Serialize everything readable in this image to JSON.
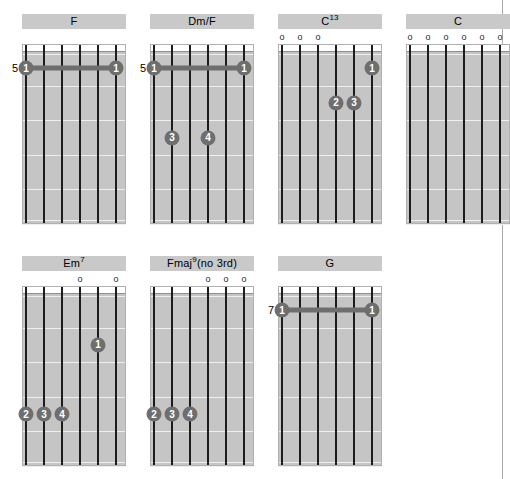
{
  "page": {
    "kind": "guitar-chord-diagram-sheet",
    "chord_count": 7,
    "strings": 6,
    "frets_per_diagram": 5,
    "colors": {
      "title_bar": "#c9c9c9",
      "board_fill": "#c5c5c5",
      "string": "#1c1c1c",
      "marker": "#6e6e6e",
      "marker_text": "#ffffff",
      "page_background": "#ffffff"
    }
  },
  "chords": [
    {
      "id": "chord-f",
      "name": "F",
      "name_base": "F",
      "name_sup": "",
      "name_tail": "",
      "position_label": "5",
      "open_strings": [],
      "barre": {
        "from_string": 1,
        "to_string": 6,
        "fret": 1,
        "finger": "1"
      },
      "dots": []
    },
    {
      "id": "chord-dm-f",
      "name": "Dm/F",
      "name_base": "Dm/F",
      "name_sup": "",
      "name_tail": "",
      "position_label": "5",
      "open_strings": [],
      "barre": {
        "from_string": 1,
        "to_string": 6,
        "fret": 1,
        "finger": "1"
      },
      "dots": [
        {
          "string": 2,
          "fret": 3,
          "finger": "3"
        },
        {
          "string": 4,
          "fret": 3,
          "finger": "4"
        }
      ]
    },
    {
      "id": "chord-c13",
      "name": "C13",
      "name_base": "C",
      "name_sup": "13",
      "name_tail": "",
      "position_label": "",
      "open_strings": [
        1,
        2,
        3
      ],
      "barre": null,
      "dots": [
        {
          "string": 6,
          "fret": 1,
          "finger": "1"
        },
        {
          "string": 4,
          "fret": 2,
          "finger": "2"
        },
        {
          "string": 5,
          "fret": 2,
          "finger": "3"
        }
      ]
    },
    {
      "id": "chord-c",
      "name": "C",
      "name_base": "C",
      "name_sup": "",
      "name_tail": "",
      "position_label": "",
      "open_strings": [
        1,
        2,
        3,
        4,
        5,
        6
      ],
      "barre": null,
      "dots": []
    },
    {
      "id": "chord-em7",
      "name": "Em7",
      "name_base": "Em",
      "name_sup": "7",
      "name_tail": "",
      "position_label": "",
      "open_strings": [
        4,
        6
      ],
      "barre": null,
      "dots": [
        {
          "string": 5,
          "fret": 2,
          "finger": "1"
        },
        {
          "string": 1,
          "fret": 4,
          "finger": "2"
        },
        {
          "string": 2,
          "fret": 4,
          "finger": "3"
        },
        {
          "string": 3,
          "fret": 4,
          "finger": "4"
        }
      ]
    },
    {
      "id": "chord-fmaj9-no3rd",
      "name": "Fmaj9(no 3rd)",
      "name_base": "Fmaj",
      "name_sup": "9",
      "name_tail": "(no 3rd)",
      "position_label": "",
      "open_strings": [
        4,
        5,
        6
      ],
      "barre": null,
      "dots": [
        {
          "string": 1,
          "fret": 4,
          "finger": "2"
        },
        {
          "string": 2,
          "fret": 4,
          "finger": "3"
        },
        {
          "string": 3,
          "fret": 4,
          "finger": "4"
        }
      ]
    },
    {
      "id": "chord-g",
      "name": "G",
      "name_base": "G",
      "name_sup": "",
      "name_tail": "",
      "position_label": "7",
      "open_strings": [],
      "barre": {
        "from_string": 1,
        "to_string": 6,
        "fret": 1,
        "finger": "1"
      },
      "dots": []
    }
  ],
  "layout": {
    "rows": [
      {
        "top": 14,
        "chords": [
          "chord-f",
          "chord-dm-f",
          "chord-c13",
          "chord-c"
        ],
        "lefts": [
          0,
          128,
          256,
          384
        ]
      },
      {
        "top": 256,
        "chords": [
          "chord-em7",
          "chord-fmaj9-no3rd",
          "chord-g"
        ],
        "lefts": [
          0,
          128,
          256
        ]
      }
    ]
  }
}
